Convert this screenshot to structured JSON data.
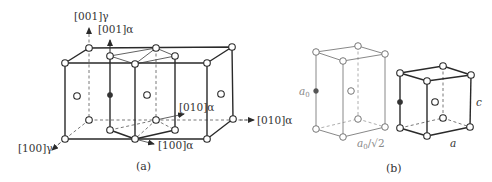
{
  "figure": {
    "panels": [
      {
        "id": "a",
        "caption": "(a)",
        "labels": {
          "z_gamma": "[001]γ",
          "z_alpha": "[001]α",
          "x_gamma": "[100]γ",
          "x_alpha": "[100]α",
          "y_alpha_inner": "[010]α",
          "y_alpha_outer": "[010]α"
        },
        "description": "Two adjacent FCC austenite (γ) cells with the embedded body-centred tetragonal α cell (Bain correspondence)"
      },
      {
        "id": "b",
        "caption": "(b)",
        "labels": {
          "height": "a0",
          "height_sub": "0",
          "base_edge": "a0/√2",
          "tetragonal_c": "c",
          "tetragonal_a": "a"
        },
        "description": "Body-centred tetragonal cell extracted from FCC lattice (left) and the resulting BCT/BCC cell (right)"
      }
    ],
    "colors": {
      "line": "#2a2a2a",
      "dashed": "#555555",
      "gray_cell": "#888888",
      "filled_atom": "#333333",
      "open_atom": "#ffffff"
    }
  }
}
